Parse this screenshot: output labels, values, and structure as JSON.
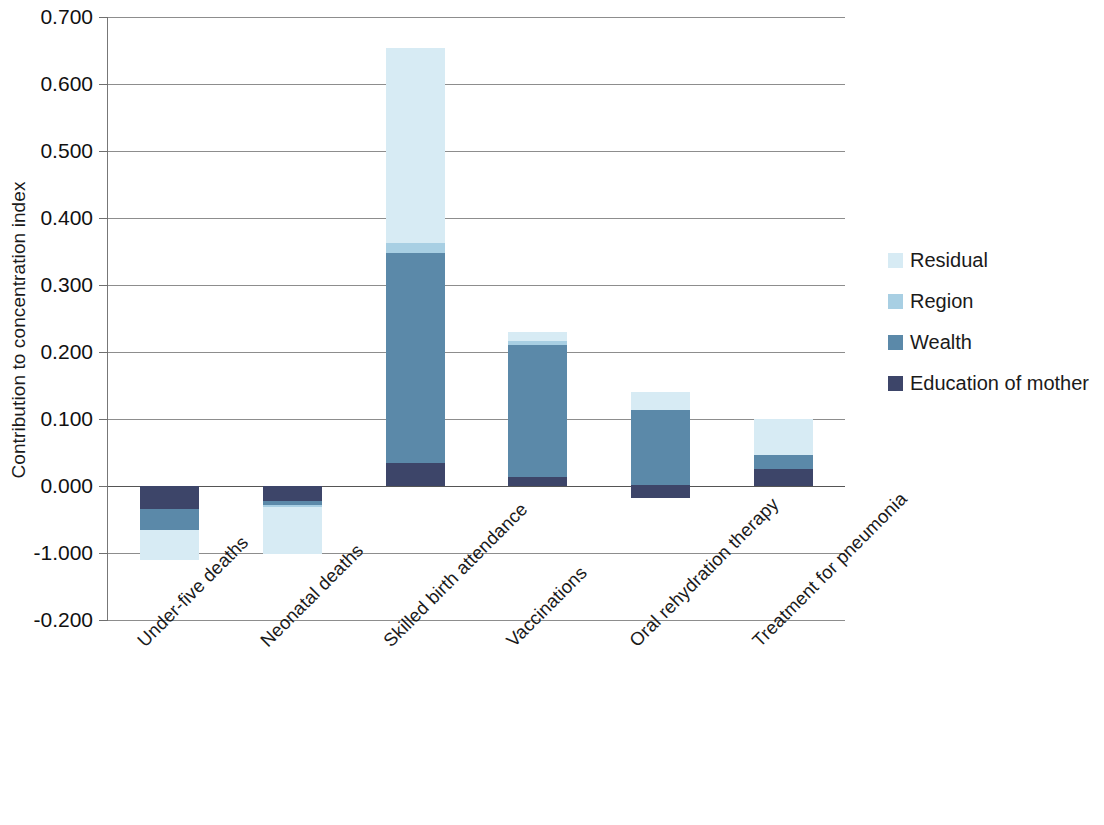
{
  "chart_data": {
    "type": "bar",
    "subtype": "stacked-bar-with-negative-values",
    "title": "",
    "xlabel": "",
    "ylabel": "Contribution to concentration index",
    "ylim": [
      -0.2,
      0.7
    ],
    "ytick_labels": [
      "0.700",
      "0.600",
      "0.500",
      "0.400",
      "0.300",
      "0.200",
      "0.100",
      "0.000",
      "-1.000",
      "-0.200"
    ],
    "ytick_values": [
      0.7,
      0.6,
      0.5,
      0.4,
      0.3,
      0.2,
      0.1,
      0.0,
      -0.1,
      -0.2
    ],
    "grid": true,
    "legend_position": "right",
    "categories": [
      "Under-five deaths",
      "Neonatal deaths",
      "Skilled birth attendance",
      "Vaccinations",
      "Oral rehydration therapy",
      "Treatment for pneumonia"
    ],
    "series": [
      {
        "name": "Education of mother",
        "color": "#3d4569",
        "values": [
          -0.034,
          -0.022,
          0.035,
          0.014,
          0.02,
          0.025
        ]
      },
      {
        "name": "Wealth",
        "color": "#5b89a9",
        "values": [
          -0.031,
          -0.006,
          0.313,
          0.196,
          0.111,
          0.022
        ]
      },
      {
        "name": "Region",
        "color": "#a8cfe3",
        "values": [
          0.0,
          -0.003,
          0.014,
          0.006,
          0.0,
          0.0
        ]
      },
      {
        "name": "Residual",
        "color": "#d7ebf4",
        "values": [
          -0.046,
          -0.071,
          0.292,
          0.014,
          0.027,
          0.053
        ]
      }
    ],
    "bar_totals": [
      -0.111,
      -0.102,
      0.654,
      0.23,
      0.158,
      0.1
    ],
    "negative_bar_bases": [
      -0.018
    ]
  },
  "legend": {
    "items": [
      {
        "label": "Residual",
        "color": "#d7ebf4",
        "swatch": "legend-swatch-residual"
      },
      {
        "label": "Region",
        "color": "#a8cfe3",
        "swatch": "legend-swatch-region"
      },
      {
        "label": "Wealth",
        "color": "#5b89a9",
        "swatch": "legend-swatch-wealth"
      },
      {
        "label": "Education of mother",
        "color": "#3d4569",
        "swatch": "legend-swatch-education"
      }
    ]
  }
}
